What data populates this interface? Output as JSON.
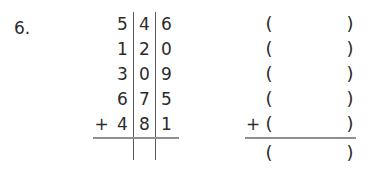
{
  "problem": {
    "number_label": "6.",
    "operation": "column-addition",
    "plus_sign": "+"
  },
  "numeric_column": {
    "place_headers": [
      "hundreds",
      "tens",
      "ones"
    ],
    "rows": [
      {
        "plus": "",
        "hundreds": "5",
        "tens": "4",
        "ones": "6",
        "value": "546"
      },
      {
        "plus": "",
        "hundreds": "1",
        "tens": "2",
        "ones": "0",
        "value": "120"
      },
      {
        "plus": "",
        "hundreds": "3",
        "tens": "0",
        "ones": "9",
        "value": "309"
      },
      {
        "plus": "",
        "hundreds": "6",
        "tens": "7",
        "ones": "5",
        "value": "675"
      },
      {
        "plus": "+",
        "hundreds": "4",
        "tens": "8",
        "ones": "1",
        "value": "481"
      }
    ],
    "sum_row": {
      "plus": "",
      "hundreds": "",
      "tens": "",
      "ones": "",
      "value": ""
    },
    "has_rule": true,
    "column_dividers": 2
  },
  "paren_column": {
    "open_paren": "(",
    "close_paren": ")",
    "rows": [
      {
        "plus": "",
        "open": "(",
        "value": "",
        "close": ")"
      },
      {
        "plus": "",
        "open": "(",
        "value": "",
        "close": ")"
      },
      {
        "plus": "",
        "open": "(",
        "value": "",
        "close": ")"
      },
      {
        "plus": "",
        "open": "(",
        "value": "",
        "close": ")"
      },
      {
        "plus": "+",
        "open": "(",
        "value": "",
        "close": ")"
      }
    ],
    "sum_row": {
      "plus": "",
      "open": "(",
      "value": "",
      "close": ")"
    },
    "has_rule": true
  },
  "colors": {
    "background": "#ffffff",
    "text": "#2b2b2b",
    "rule": "#8f8f8f",
    "divider": "#5a5a5a"
  }
}
